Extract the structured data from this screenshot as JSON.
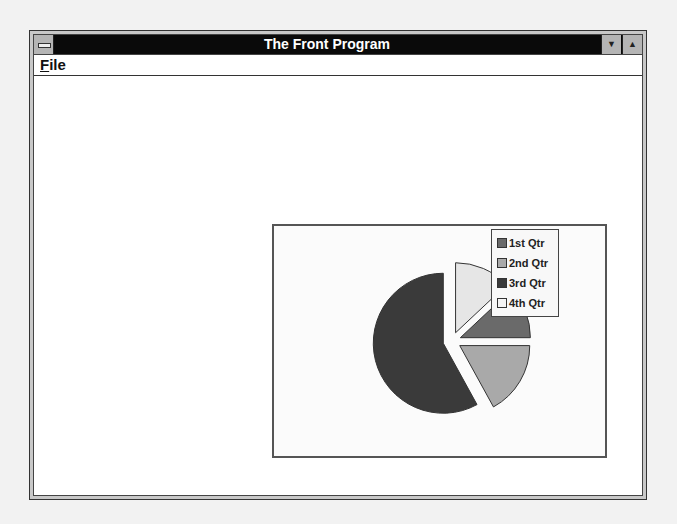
{
  "window": {
    "title": "The Front Program",
    "system_menu_icon": "system-menu-icon",
    "minimize_icon": "▼",
    "maximize_icon": "▲"
  },
  "menubar": {
    "items": [
      {
        "label": "File",
        "mnemonic": "F"
      }
    ]
  },
  "chart": {
    "legend": [
      {
        "label": "1st Qtr",
        "color": "#6a6a6a"
      },
      {
        "label": "2nd Qtr",
        "color": "#a9a9a9"
      },
      {
        "label": "3rd Qtr",
        "color": "#3a3a3a"
      },
      {
        "label": "4th Qtr",
        "color": "#e6e6e6"
      }
    ]
  },
  "chart_data": {
    "type": "pie",
    "title": "",
    "categories": [
      "1st Qtr",
      "2nd Qtr",
      "3rd Qtr",
      "4th Qtr"
    ],
    "values": [
      12,
      17,
      58,
      13
    ],
    "exploded": true,
    "legend_position": "top-right",
    "colors": [
      "#6a6a6a",
      "#a9a9a9",
      "#3a3a3a",
      "#e6e6e6"
    ]
  }
}
